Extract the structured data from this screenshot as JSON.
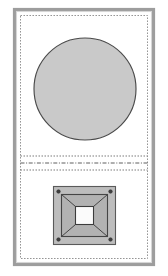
{
  "drawing": {
    "title": "Plan view: circular element over square flange plate",
    "canvas": {
      "width": 168,
      "height": 276,
      "background": "#ffffff"
    },
    "frame": {
      "label": "sheet-border",
      "outer": {
        "x": 14.5,
        "y": 9.5,
        "width": 139,
        "height": 255,
        "stroke": "#9d9d9d",
        "stroke_width": 3.2
      },
      "highlight": {
        "x": 16.5,
        "y": 11.5,
        "width": 135,
        "height": 251,
        "stroke": "#d6d6d6"
      },
      "dotted_boundary": {
        "x": 20.5,
        "y": 15.5,
        "width": 127,
        "height": 243,
        "stroke": "#8a8a8a",
        "dash": "1.4 1.6"
      }
    },
    "circle": {
      "label": "circular-plan-element",
      "cx": 85,
      "cy": 89,
      "r": 51,
      "fill": "#c9c9c9",
      "stroke": "#4a4a4a",
      "stroke_width": 1.15
    },
    "parting_lines": [
      {
        "label": "parting-line-upper",
        "y": 156,
        "x1": 20.5,
        "x2": 147.5,
        "style": "dashed",
        "stroke": "#7b7b7b"
      },
      {
        "label": "parting-line-center",
        "y": 163,
        "x1": 20.5,
        "x2": 147.5,
        "style": "dash-dot",
        "stroke": "#5f5f5f"
      },
      {
        "label": "parting-line-lower",
        "y": 170,
        "x1": 20.5,
        "x2": 147.5,
        "style": "dashed",
        "stroke": "#7b7b7b"
      }
    ],
    "plate": {
      "label": "square-flange-plate",
      "outer": {
        "x": 53.5,
        "y": 186.5,
        "width": 62,
        "height": 58,
        "fill": "#bdbdbd",
        "stroke": "#5a5a5a"
      },
      "inner_rim": {
        "x": 61.5,
        "y": 194.5,
        "width": 46,
        "height": 42,
        "fill": "#b2b2b2",
        "stroke": "#454545"
      },
      "aperture": {
        "x": 75.5,
        "y": 206.5,
        "width": 18,
        "height": 18,
        "fill": "#fbfbfb",
        "stroke": "#3c3c3c"
      },
      "taper_lines": [
        {
          "label": "taper-line-top-left",
          "x1": 61.5,
          "y1": 194.5,
          "x2": 75.5,
          "y2": 206.5
        },
        {
          "label": "taper-line-top-right",
          "x1": 107.5,
          "y1": 194.5,
          "x2": 93.5,
          "y2": 206.5
        },
        {
          "label": "taper-line-bottom-left",
          "x1": 61.5,
          "y1": 236.5,
          "x2": 75.5,
          "y2": 224.5
        },
        {
          "label": "taper-line-bottom-right",
          "x1": 107.5,
          "y1": 236.5,
          "x2": 93.5,
          "y2": 224.5
        }
      ],
      "bolt_holes": [
        {
          "label": "bolt-hole-top-left",
          "cx": 58.5,
          "cy": 191.5,
          "r": 1.8
        },
        {
          "label": "bolt-hole-top-right",
          "cx": 110.5,
          "cy": 191.5,
          "r": 1.8
        },
        {
          "label": "bolt-hole-bottom-left",
          "cx": 58.5,
          "cy": 239.5,
          "r": 1.8
        },
        {
          "label": "bolt-hole-bottom-right",
          "cx": 110.5,
          "cy": 239.5,
          "r": 1.8
        }
      ]
    }
  }
}
